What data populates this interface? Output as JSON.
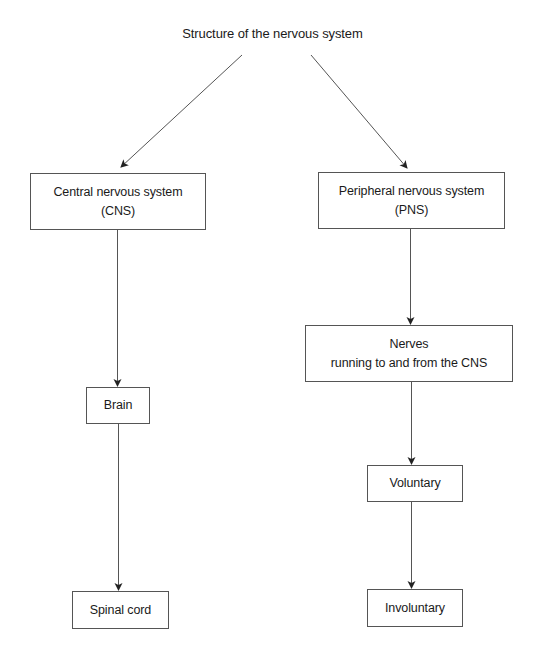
{
  "diagram": {
    "title": "Structure of the nervous system",
    "nodes": {
      "cns": {
        "line1": "Central nervous system",
        "line2": "(CNS)"
      },
      "pns": {
        "line1": "Peripheral nervous system",
        "line2": "(PNS)"
      },
      "brain": {
        "line1": "Brain"
      },
      "spinal_cord": {
        "line1": "Spinal cord"
      },
      "nerves": {
        "line1": "Nerves",
        "line2": "running to and from the CNS"
      },
      "voluntary": {
        "line1": "Voluntary"
      },
      "involuntary": {
        "line1": "Involuntary"
      }
    },
    "edges": [
      {
        "from": "title",
        "to": "cns"
      },
      {
        "from": "title",
        "to": "pns"
      },
      {
        "from": "cns",
        "to": "brain"
      },
      {
        "from": "brain",
        "to": "spinal_cord"
      },
      {
        "from": "pns",
        "to": "nerves"
      },
      {
        "from": "nerves",
        "to": "voluntary"
      },
      {
        "from": "voluntary",
        "to": "involuntary"
      }
    ],
    "colors": {
      "line": "#555555",
      "border": "#555555",
      "text": "#1a1a1a",
      "background": "#ffffff"
    }
  }
}
